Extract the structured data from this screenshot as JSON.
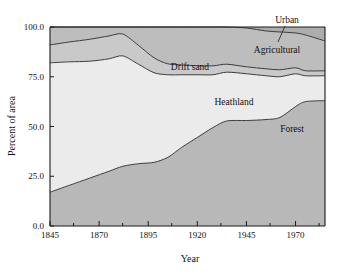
{
  "chart_data": {
    "type": "area",
    "title": "",
    "subtitle": "",
    "xlabel": "Year",
    "ylabel": "Percent of area",
    "stacked": true,
    "grid": false,
    "legend": "inline-area-labels",
    "xlim": [
      1845,
      1985
    ],
    "ylim": [
      0,
      100
    ],
    "xticks": [
      1845,
      1870,
      1895,
      1920,
      1945,
      1970
    ],
    "xtick_labels": [
      "1845",
      "1870",
      "1895",
      "1920",
      "1945",
      "1970"
    ],
    "xminor_ticks": [
      1857,
      1882,
      1907,
      1932,
      1957,
      1982
    ],
    "yticks": [
      0,
      25,
      50,
      75,
      100
    ],
    "ytick_labels": [
      "0.0",
      "25.0",
      "50.0",
      "75.0",
      "100.0"
    ],
    "x": [
      1845,
      1855,
      1865,
      1875,
      1882,
      1890,
      1898,
      1905,
      1912,
      1920,
      1928,
      1935,
      1945,
      1955,
      1962,
      1970,
      1975,
      1985
    ],
    "series": [
      {
        "name": "Forest",
        "label": "Forest",
        "color": "#b8b8b8",
        "values": [
          17.0,
          20.5,
          24.0,
          27.5,
          30.0,
          31.3,
          32.0,
          34.5,
          39.5,
          44.5,
          49.5,
          52.8,
          53.0,
          53.5,
          54.5,
          60.0,
          62.5,
          63.0
        ]
      },
      {
        "name": "Heathland",
        "label": "Heathland",
        "color": "#ebebeb",
        "values": [
          65.0,
          62.0,
          58.8,
          56.5,
          55.5,
          50.0,
          45.0,
          41.5,
          36.5,
          31.5,
          26.5,
          24.5,
          23.5,
          22.0,
          20.5,
          16.5,
          13.0,
          12.5
        ]
      },
      {
        "name": "Drift sand",
        "label": "Drift sand",
        "color": "#c9c9c9",
        "values": [
          9.0,
          10.0,
          11.0,
          11.5,
          11.0,
          9.5,
          7.5,
          5.5,
          5.0,
          4.5,
          4.5,
          4.0,
          3.5,
          3.5,
          3.5,
          3.0,
          2.5,
          2.5
        ]
      },
      {
        "name": "Agricultural",
        "label": "Agricultural",
        "color": "#bdbdbd",
        "values": [
          9.0,
          7.5,
          6.2,
          4.5,
          3.5,
          9.2,
          15.5,
          18.5,
          19.0,
          19.5,
          19.5,
          18.7,
          19.5,
          19.0,
          19.0,
          17.5,
          18.0,
          15.0
        ]
      },
      {
        "name": "Urban",
        "label": "Urban",
        "color": "#adadad",
        "values": [
          0.0,
          0.0,
          0.0,
          0.0,
          0.0,
          0.0,
          0.0,
          0.0,
          0.0,
          0.0,
          0.0,
          0.0,
          0.5,
          2.0,
          2.5,
          3.0,
          4.0,
          7.0
        ]
      }
    ],
    "annotations": [
      {
        "text": "Urban",
        "type": "callout-with-leader"
      },
      {
        "text": "Agricultural",
        "type": "inline"
      },
      {
        "text": "Drift sand",
        "type": "inline"
      },
      {
        "text": "Heathland",
        "type": "inline"
      },
      {
        "text": "Forest",
        "type": "inline"
      }
    ]
  },
  "colors": {
    "forest": "#b8b8b8",
    "heathland": "#ebebeb",
    "drift_sand": "#c9c9c9",
    "agricultural": "#bdbdbd",
    "urban": "#adadad",
    "axis": "#1a1a1a",
    "background": "#ffffff"
  }
}
